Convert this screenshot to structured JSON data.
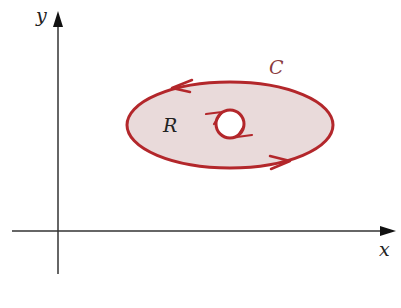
{
  "diagram": {
    "axes": {
      "x_label": "x",
      "y_label": "y"
    },
    "region": {
      "label": "R",
      "fill_color": "#e9dada"
    },
    "curve": {
      "label": "C",
      "stroke_color": "#b3272b",
      "outer_orientation": "counterclockwise",
      "inner_orientation": "clockwise"
    },
    "axis_color": "#333333",
    "label_color_dark": "#222222",
    "label_color_curve": "#8a3a3e"
  }
}
